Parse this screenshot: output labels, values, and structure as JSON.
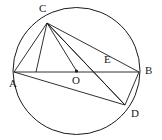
{
  "figure": {
    "type": "circle-geometry-diagram",
    "width": 162,
    "height": 140,
    "background_color": "#ffffff",
    "stroke_color": "#1a1a1a",
    "label_color": "#1a1a1a"
  },
  "circle": {
    "name": "circle-O",
    "center_x": 76.5,
    "center_y": 71,
    "radius": 63.5
  },
  "points": [
    {
      "id": "A",
      "label": "A",
      "x": 14,
      "y": 72,
      "label_x": 9,
      "label_y": 80,
      "on_circle": true
    },
    {
      "id": "B",
      "label": "B",
      "x": 139,
      "y": 72,
      "label_x": 144,
      "label_y": 65,
      "on_circle": true
    },
    {
      "id": "C",
      "label": "C",
      "x": 47,
      "y": 23,
      "label_x": 39,
      "label_y": 3,
      "on_circle": true
    },
    {
      "id": "D",
      "label": "D",
      "x": 125,
      "y": 105,
      "label_x": 131,
      "label_y": 110,
      "on_circle": true
    },
    {
      "id": "O",
      "label": "O",
      "x": 76.5,
      "y": 71,
      "label_x": 73,
      "label_y": 76,
      "on_circle": false
    },
    {
      "id": "E",
      "label": "E",
      "x": 110,
      "y": 72,
      "label_x": 106,
      "label_y": 55,
      "on_circle": false
    }
  ],
  "segments": [
    {
      "name": "segment-AB",
      "from": "A",
      "to": "B"
    },
    {
      "name": "segment-AC",
      "from": "A",
      "to": "C"
    },
    {
      "name": "segment-AD",
      "from": "A",
      "to": "D"
    },
    {
      "name": "segment-CB",
      "from": "C",
      "to": "B"
    },
    {
      "name": "segment-CD",
      "from": "C",
      "to": "D"
    },
    {
      "name": "segment-CO",
      "from": "C",
      "to": "O"
    },
    {
      "name": "segment-CE",
      "from": "C",
      "to": "E"
    },
    {
      "name": "segment-CA2",
      "from": "C",
      "to": "A"
    },
    {
      "name": "segment-BD",
      "from": "B",
      "to": "D"
    }
  ],
  "markers": [
    {
      "name": "center-dot-O",
      "x": 76.5,
      "y": 71,
      "r": 1.6
    }
  ]
}
